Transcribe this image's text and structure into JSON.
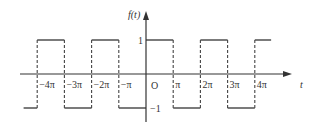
{
  "diagram": {
    "y_axis_label": "f(t)",
    "x_axis_label": "t",
    "origin_label": "O",
    "levels": {
      "high": 1,
      "low": -1,
      "high_label": "1",
      "low_label": "−1"
    },
    "x_ticks": [
      {
        "value": -4,
        "label": "−4π"
      },
      {
        "value": -3,
        "label": "−3π"
      },
      {
        "value": -2,
        "label": "−2π"
      },
      {
        "value": -1,
        "label": "−π"
      },
      {
        "value": 1,
        "label": "π"
      },
      {
        "value": 2,
        "label": "2π"
      },
      {
        "value": 3,
        "label": "3π"
      },
      {
        "value": 4,
        "label": "4π"
      }
    ],
    "waveform": {
      "period_pi": 2,
      "segments": [
        {
          "from": -4.5,
          "to": -4,
          "level": -1
        },
        {
          "from": -4,
          "to": -3,
          "level": 1
        },
        {
          "from": -3,
          "to": -2,
          "level": -1
        },
        {
          "from": -2,
          "to": -1,
          "level": 1
        },
        {
          "from": -1,
          "to": 0,
          "level": -1
        },
        {
          "from": 0,
          "to": 1,
          "level": 1
        },
        {
          "from": 1,
          "to": 2,
          "level": -1
        },
        {
          "from": 2,
          "to": 3,
          "level": 1
        },
        {
          "from": 3,
          "to": 4,
          "level": -1
        },
        {
          "from": 4,
          "to": 4.6,
          "level": 1
        }
      ]
    },
    "colors": {
      "line": "#333333",
      "dashed": "#444444"
    }
  }
}
